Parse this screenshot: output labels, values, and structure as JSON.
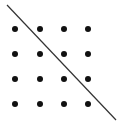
{
  "diagram": {
    "type": "dot-grid-with-line",
    "background": "#ffffff",
    "dot_color": "#111111",
    "line_color": "#333333",
    "grid": {
      "rows": 4,
      "cols": 4,
      "x_positions": [
        15,
        40,
        64,
        88
      ],
      "y_positions": [
        29,
        54,
        79,
        104
      ],
      "dot_radius": 3
    },
    "line": {
      "x1": 7,
      "y1": 5,
      "x2": 116,
      "y2": 120,
      "width": 1.2
    }
  }
}
